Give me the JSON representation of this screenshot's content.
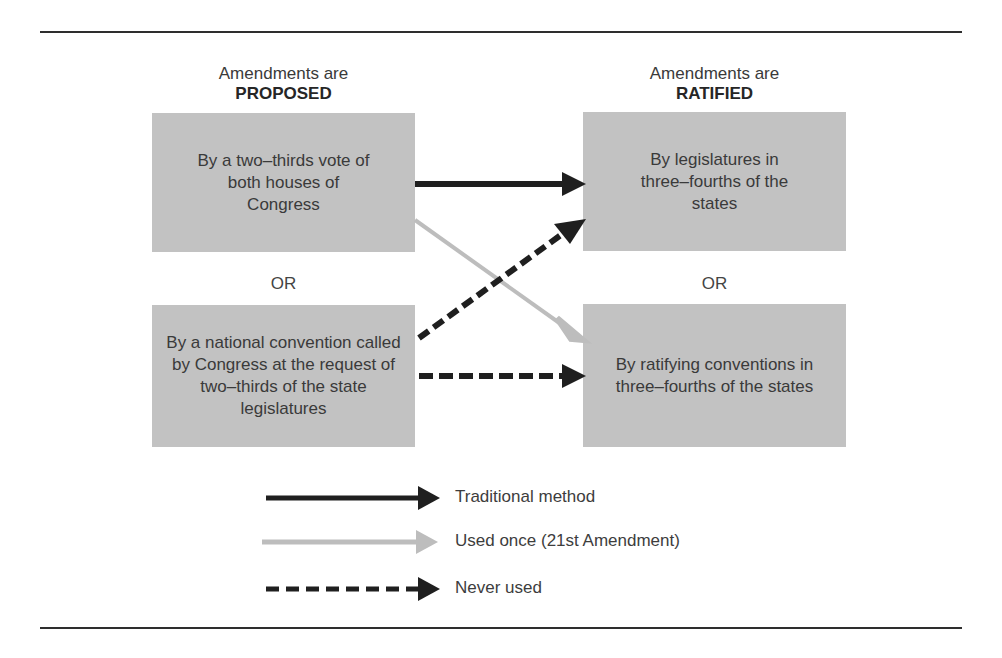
{
  "proposed": {
    "heading": "Amendments are",
    "emphasis": "PROPOSED",
    "methods": [
      {
        "text": "By a two–thirds vote of both houses of Congress"
      },
      {
        "text": "By a national convention called by Congress at the request of two–thirds of the state legislatures"
      }
    ],
    "separator": "OR"
  },
  "ratified": {
    "heading": "Amendments are",
    "emphasis": "RATIFIED",
    "methods": [
      {
        "text": "By legislatures in three–fourths of the states"
      },
      {
        "text": "By ratifying conventions in three–fourths of the states"
      }
    ],
    "separator": "OR"
  },
  "connections": [
    {
      "from": "proposed.0",
      "to": "ratified.0",
      "style": "solid-black",
      "meaning": "Traditional method"
    },
    {
      "from": "proposed.0",
      "to": "ratified.1",
      "style": "solid-gray",
      "meaning": "Used once (21st Amendment)"
    },
    {
      "from": "proposed.1",
      "to": "ratified.0",
      "style": "dashed-black",
      "meaning": "Never used"
    },
    {
      "from": "proposed.1",
      "to": "ratified.1",
      "style": "dashed-black",
      "meaning": "Never used"
    }
  ],
  "legend": [
    {
      "label": "Traditional method",
      "style": "solid-black",
      "color": "#1f1f1f"
    },
    {
      "label": "Used once (21st Amendment)",
      "style": "solid-gray",
      "color": "#bdbdbd"
    },
    {
      "label": "Never used",
      "style": "dashed-black",
      "color": "#1f1f1f"
    }
  ],
  "colors": {
    "box_fill": "#c2c2c2",
    "arrow_dark": "#1f1f1f",
    "arrow_light": "#bdbdbd",
    "rule": "#2e2e2e"
  }
}
